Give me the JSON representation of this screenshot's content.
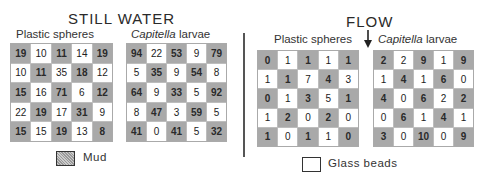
{
  "still_water": {
    "title": "STILL WATER",
    "plastic": {
      "label": "Plastic spheres",
      "rows": [
        [
          19,
          10,
          11,
          14,
          19
        ],
        [
          10,
          11,
          35,
          18,
          12
        ],
        [
          15,
          16,
          71,
          6,
          12
        ],
        [
          22,
          19,
          17,
          31,
          9
        ],
        [
          15,
          15,
          19,
          13,
          8
        ]
      ]
    },
    "capitella": {
      "label_italic": "Capitella",
      "label_rest": " larvae",
      "rows": [
        [
          94,
          22,
          53,
          9,
          79
        ],
        [
          5,
          35,
          9,
          54,
          8
        ],
        [
          64,
          9,
          33,
          5,
          92
        ],
        [
          8,
          47,
          3,
          59,
          5
        ],
        [
          41,
          0,
          41,
          5,
          32
        ]
      ]
    }
  },
  "flow": {
    "title": "FLOW",
    "arrow": "down-arrow-icon",
    "plastic": {
      "label": "Plastic spheres",
      "rows": [
        [
          0,
          1,
          1,
          1,
          1
        ],
        [
          1,
          1,
          7,
          4,
          3
        ],
        [
          0,
          1,
          3,
          5,
          1
        ],
        [
          1,
          2,
          0,
          2,
          0
        ],
        [
          1,
          0,
          1,
          1,
          0
        ]
      ]
    },
    "capitella": {
      "label_italic": "Capitella",
      "label_rest": " larvae",
      "rows": [
        [
          2,
          2,
          9,
          1,
          9
        ],
        [
          1,
          4,
          1,
          6,
          0
        ],
        [
          4,
          0,
          6,
          2,
          2
        ],
        [
          0,
          6,
          1,
          4,
          1
        ],
        [
          3,
          0,
          10,
          0,
          9
        ]
      ]
    }
  },
  "legend": {
    "mud": "Mud",
    "glass": "Glass beads"
  },
  "colors": {
    "mud_cell": "#a9a9a9",
    "glass_cell": "#ffffff"
  }
}
